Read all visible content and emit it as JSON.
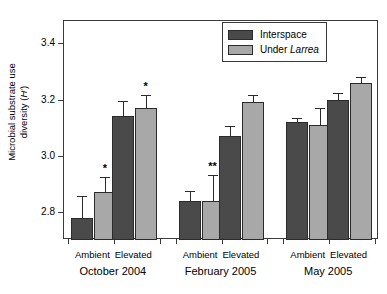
{
  "chart_data": {
    "type": "bar",
    "title": "",
    "xlabel": "",
    "ylabel": "Microbial substrate use diversity (H′)",
    "ylim": [
      2.7,
      3.48
    ],
    "yticks": [
      2.8,
      3.0,
      3.2,
      3.4
    ],
    "ytick_labels": [
      "2.8",
      "3.0",
      "3.2",
      "3.4"
    ],
    "grid": false,
    "legend_position": "top-right",
    "groups": [
      "October 2004",
      "February 2005",
      "May 2005"
    ],
    "conditions": [
      "Ambient",
      "Elevated"
    ],
    "categories": [
      "October 2004 Ambient",
      "October 2004 Elevated",
      "February 2005 Ambient",
      "February 2005 Elevated",
      "May 2005 Ambient",
      "May 2005 Elevated"
    ],
    "series": [
      {
        "name": "Interspace",
        "color": "#4a4a4a",
        "values": [
          2.78,
          3.14,
          2.84,
          3.07,
          3.12,
          3.2
        ],
        "errors": [
          0.075,
          0.055,
          0.035,
          0.035,
          0.015,
          0.025
        ]
      },
      {
        "name": "Under Larrea",
        "color": "#a8a8a8",
        "values": [
          2.87,
          3.17,
          2.84,
          3.19,
          3.11,
          3.26
        ],
        "errors": [
          0.055,
          0.045,
          0.09,
          0.025,
          0.06,
          0.02
        ]
      }
    ],
    "annotations": [
      {
        "label": "*",
        "category": "October 2004 Ambient",
        "series": "Under Larrea"
      },
      {
        "label": "*",
        "category": "October 2004 Elevated",
        "series": "Under Larrea"
      },
      {
        "label": "**",
        "category": "February 2005 Ambient",
        "series": "Under Larrea"
      }
    ]
  },
  "legend": {
    "items": [
      {
        "label": "Interspace",
        "label_plain": "Interspace",
        "label_italic": ""
      },
      {
        "label": "Under Larrea",
        "label_plain": "Under ",
        "label_italic": "Larrea"
      }
    ]
  },
  "axis": {
    "y_title_line1": "Microbial substrate use",
    "y_title_line2_plain": "diversity (",
    "y_title_line2_italic": "H",
    "y_title_line2_tail": "′)"
  }
}
